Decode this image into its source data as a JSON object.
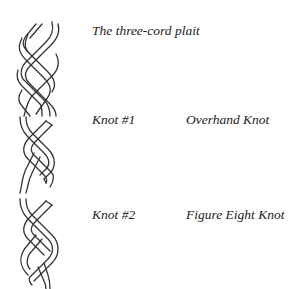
{
  "rows": [
    {
      "figure": "three-cord-plait",
      "title": "The three-cord plait",
      "name": ""
    },
    {
      "figure": "overhand-knot",
      "title": "Knot #1",
      "name": "Overhand Knot"
    },
    {
      "figure": "figure-eight-knot",
      "title": "Knot #2",
      "name": "Figure Eight Knot"
    }
  ]
}
